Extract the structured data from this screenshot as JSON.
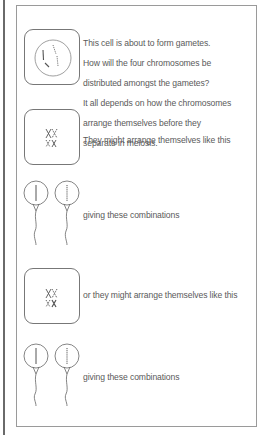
{
  "intro": {
    "lines": [
      "This cell is about to form gametes.",
      "How will the four chromosomes be",
      "distributed amongst the gametes?",
      "It all depends on how the chromosomes",
      "arrange themselves before they",
      "separate in meiosis."
    ]
  },
  "arrangement_1": {
    "caption": "They might arrange themselves like this"
  },
  "gametes_1": {
    "caption": "giving these combinations"
  },
  "arrangement_2": {
    "caption": "or they might arrange themselves like this"
  },
  "gametes_2": {
    "caption": "giving these combinations"
  },
  "icons": {
    "cell": "cell-with-chromosomes-icon",
    "metaphase": "paired-chromosomes-icon",
    "sperm": "sperm-gamete-icon"
  },
  "colors": {
    "line": "#777777",
    "text": "#5a5a5a",
    "frame": "#9a9a9a"
  }
}
